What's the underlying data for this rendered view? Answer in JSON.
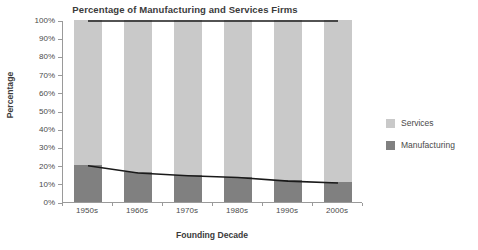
{
  "chart_data": {
    "type": "bar",
    "title": "Percentage of Manufacturing and Services Firms",
    "xlabel": "Founding Decade",
    "ylabel": "Percentage",
    "categories": [
      "1950s",
      "1960s",
      "1970s",
      "1980s",
      "1990s",
      "2000s"
    ],
    "series": [
      {
        "name": "Manufacturing",
        "values": [
          20.5,
          16.5,
          15.0,
          14.0,
          12.0,
          11.0
        ],
        "color": "#808080"
      },
      {
        "name": "Services",
        "values": [
          79.5,
          83.5,
          85.0,
          86.0,
          88.0,
          89.0
        ],
        "color": "#c9c9c9"
      }
    ],
    "overlay_lines": [
      {
        "name": "Total",
        "values": [
          100,
          100,
          100,
          100,
          100,
          100
        ],
        "color": "#1a1a1a"
      },
      {
        "name": "Manufacturing trend",
        "values": [
          20.5,
          16.5,
          15.0,
          14.0,
          12.0,
          11.0
        ],
        "color": "#1a1a1a"
      }
    ],
    "ylim": [
      0,
      100
    ],
    "ytick_labels": [
      "100%",
      "90%",
      "80%",
      "70%",
      "60%",
      "50%",
      "40%",
      "30%",
      "20%",
      "10%",
      "0%"
    ],
    "ytick_values": [
      100,
      90,
      80,
      70,
      60,
      50,
      40,
      30,
      20,
      10,
      0
    ],
    "grid": false,
    "stacked": true,
    "legend_position": "right",
    "legend": [
      {
        "label": "Services",
        "color": "#c9c9c9"
      },
      {
        "label": "Manufacturing",
        "color": "#808080"
      }
    ]
  }
}
